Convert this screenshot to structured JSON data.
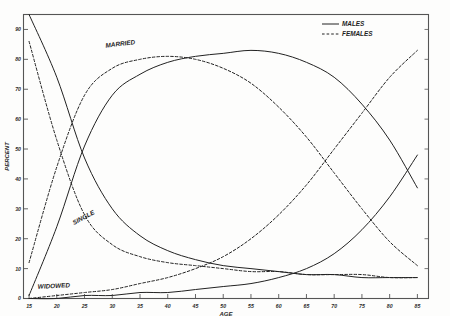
{
  "chart_data": {
    "type": "line",
    "title": "",
    "xlabel": "AGE",
    "ylabel": "PERCENT",
    "xlim": [
      14,
      87
    ],
    "ylim": [
      0,
      95
    ],
    "grid": false,
    "legend_position": "top-right",
    "xticks": [
      15,
      20,
      25,
      30,
      35,
      40,
      45,
      50,
      55,
      60,
      65,
      70,
      75,
      80,
      85
    ],
    "xtick_labels": [
      "15",
      "20",
      "25",
      "30",
      "35",
      "40",
      "45",
      "50",
      "55",
      "60",
      "65",
      "70",
      "75",
      "80",
      "85"
    ],
    "yticks": [
      0,
      10,
      20,
      30,
      40,
      50,
      60,
      70,
      80,
      90
    ],
    "ytick_labels": [
      "0",
      "10",
      "20",
      "30",
      "40",
      "50",
      "60",
      "70",
      "80",
      "90"
    ],
    "legend": [
      {
        "name": "MALES",
        "style": "solid"
      },
      {
        "name": "FEMALES",
        "style": "dashed"
      }
    ],
    "annotations": [
      {
        "text": "MARRIED",
        "x": 31.5,
        "y": 84.5
      },
      {
        "text": "SINGLE",
        "x": 25.0,
        "y": 26.5
      },
      {
        "text": "WIDOWED",
        "x": 19.5,
        "y": 3.5
      }
    ],
    "series": [
      {
        "name": "SINGLE - MALES",
        "status": "single",
        "sex": "males",
        "style": "solid",
        "x": [
          15,
          20,
          25,
          30,
          35,
          40,
          45,
          50,
          55,
          60,
          65,
          70,
          75,
          80,
          85
        ],
        "values": [
          98,
          74,
          47,
          30,
          21,
          16,
          13,
          11,
          10,
          9,
          8,
          8,
          7,
          7,
          7
        ]
      },
      {
        "name": "SINGLE - FEMALES",
        "status": "single",
        "sex": "females",
        "style": "dashed",
        "x": [
          15,
          20,
          25,
          30,
          35,
          40,
          45,
          50,
          55,
          60,
          65,
          70,
          75,
          80,
          85
        ],
        "values": [
          86,
          53,
          28,
          18,
          14,
          12,
          11,
          10,
          9,
          9,
          8,
          8,
          8,
          7,
          7
        ]
      },
      {
        "name": "MARRIED - MALES",
        "status": "married",
        "sex": "males",
        "style": "solid",
        "x": [
          15,
          20,
          25,
          30,
          35,
          40,
          45,
          50,
          55,
          60,
          65,
          70,
          75,
          80,
          85
        ],
        "values": [
          1,
          24,
          51,
          68,
          75,
          79,
          81,
          82,
          83,
          82,
          79,
          74,
          65,
          53,
          37
        ]
      },
      {
        "name": "MARRIED - FEMALES",
        "status": "married",
        "sex": "females",
        "style": "dashed",
        "x": [
          15,
          20,
          25,
          30,
          35,
          40,
          45,
          50,
          55,
          60,
          65,
          70,
          75,
          80,
          85
        ],
        "values": [
          12,
          44,
          68,
          77,
          80,
          81,
          80,
          77,
          72,
          64,
          54,
          42,
          30,
          19,
          11
        ]
      },
      {
        "name": "WIDOWED - MALES",
        "status": "widowed",
        "sex": "males",
        "style": "solid",
        "x": [
          15,
          20,
          25,
          30,
          35,
          40,
          45,
          50,
          55,
          60,
          65,
          70,
          75,
          80,
          85
        ],
        "values": [
          0,
          0,
          1,
          1,
          2,
          2,
          3,
          4,
          5,
          7,
          10,
          15,
          23,
          34,
          48
        ]
      },
      {
        "name": "WIDOWED - FEMALES",
        "status": "widowed",
        "sex": "females",
        "style": "dashed",
        "x": [
          15,
          20,
          25,
          30,
          35,
          40,
          45,
          50,
          55,
          60,
          65,
          70,
          75,
          80,
          85
        ],
        "values": [
          0,
          1,
          2,
          3,
          5,
          7,
          10,
          14,
          20,
          28,
          38,
          50,
          62,
          74,
          83
        ]
      }
    ],
    "colors": {
      "line": "#222222",
      "axis": "#555555",
      "background": "#fdfdfc"
    }
  }
}
